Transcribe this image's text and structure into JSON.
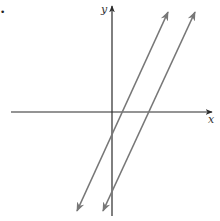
{
  "figure": {
    "marker_dot": "•",
    "axes": {
      "x_label": "x",
      "y_label": "y",
      "color": "#2a2a2a"
    },
    "lines": [
      {
        "name": "line-1",
        "description": "Steep line with positive slope crossing x-axis right of origin and y-axis below origin",
        "color": "#777777"
      },
      {
        "name": "line-2",
        "description": "Parallel line shifted right",
        "color": "#777777"
      }
    ],
    "relationship": "parallel"
  }
}
